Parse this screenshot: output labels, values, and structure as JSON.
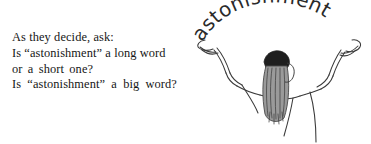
{
  "page": {
    "background_color": "#ffffff",
    "ink_color": "#171717"
  },
  "text_block": {
    "lines": [
      "As they decide, ask:",
      "Is “astonishment” a long word",
      "or a short one?",
      "Is “astonishment” a big word?"
    ]
  },
  "illustration": {
    "name": "person-with-raised-arms-holding-word",
    "arc_word": "astonishment",
    "arc_word_letters": [
      "a",
      "s",
      "t",
      "o",
      "n",
      "i",
      "s",
      "h",
      "m",
      "e",
      "n",
      "t"
    ],
    "parts": [
      "left-hand",
      "left-arm",
      "right-hand",
      "right-arm",
      "head-hair",
      "shoulders",
      "torso"
    ],
    "ink_color": "#333333",
    "hair_color": "#4a4a4a",
    "hair_top_color": "#1c1c1c"
  }
}
